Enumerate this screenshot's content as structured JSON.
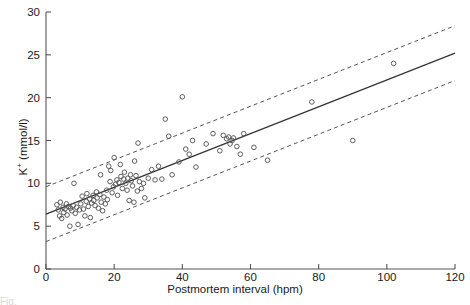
{
  "chart_data": {
    "type": "scatter",
    "title": "",
    "xlabel": "Postmortem interval (hpm)",
    "ylabel": "K+ (mmol/l)",
    "ylabel_base": "K",
    "ylabel_sup": "+",
    "ylabel_unit": " (mmol/l)",
    "xlim": [
      0,
      120
    ],
    "ylim": [
      0,
      30
    ],
    "xticks": [
      0,
      20,
      40,
      60,
      80,
      100,
      120
    ],
    "yticks": [
      0,
      5,
      10,
      15,
      20,
      25,
      30
    ],
    "grid": false,
    "legend": "none",
    "marker": "open-circle",
    "marker_color": "#555555",
    "line_color": "#333333",
    "band_color": "#555555",
    "regression_line": {
      "label": "regression line",
      "style": "solid",
      "intercept": 6.4,
      "slope": 0.1567,
      "x_start": 0,
      "x_end": 120,
      "y_start": 6.4,
      "y_end": 25.2
    },
    "prediction_band_upper": {
      "label": "upper prediction limit",
      "style": "dashed",
      "intercept": 9.6,
      "slope": 0.1567,
      "x_start": 0,
      "x_end": 120,
      "y_start": 9.6,
      "y_end": 28.4
    },
    "prediction_band_lower": {
      "label": "lower prediction limit",
      "style": "dashed",
      "intercept": 3.2,
      "slope": 0.1567,
      "x_start": 0,
      "x_end": 120,
      "y_start": 3.2,
      "y_end": 22.0
    },
    "points": [
      [
        3.2,
        7.5
      ],
      [
        3.6,
        6.9
      ],
      [
        4.0,
        6.2
      ],
      [
        4.2,
        7.8
      ],
      [
        4.6,
        5.9
      ],
      [
        5.0,
        7.2
      ],
      [
        5.2,
        6.6
      ],
      [
        5.6,
        7.0
      ],
      [
        6.0,
        7.6
      ],
      [
        6.2,
        6.3
      ],
      [
        6.6,
        7.3
      ],
      [
        7.0,
        5.0
      ],
      [
        7.2,
        7.1
      ],
      [
        7.6,
        6.8
      ],
      [
        8.0,
        7.4
      ],
      [
        8.2,
        10.0
      ],
      [
        8.6,
        6.5
      ],
      [
        9.0,
        7.2
      ],
      [
        9.4,
        5.2
      ],
      [
        9.8,
        6.9
      ],
      [
        10.2,
        7.6
      ],
      [
        10.6,
        8.5
      ],
      [
        11.0,
        7.0
      ],
      [
        11.4,
        6.2
      ],
      [
        11.8,
        7.9
      ],
      [
        12.0,
        8.8
      ],
      [
        12.4,
        7.3
      ],
      [
        12.8,
        8.2
      ],
      [
        13.0,
        6.0
      ],
      [
        13.4,
        7.7
      ],
      [
        13.8,
        8.6
      ],
      [
        14.0,
        8.0
      ],
      [
        14.4,
        7.4
      ],
      [
        14.8,
        9.0
      ],
      [
        15.0,
        8.3
      ],
      [
        15.4,
        7.1
      ],
      [
        15.8,
        8.7
      ],
      [
        16.0,
        11.0
      ],
      [
        16.2,
        7.8
      ],
      [
        16.6,
        6.8
      ],
      [
        17.0,
        8.4
      ],
      [
        17.4,
        7.6
      ],
      [
        17.8,
        9.2
      ],
      [
        18.0,
        8.1
      ],
      [
        18.4,
        12.0
      ],
      [
        18.8,
        10.2
      ],
      [
        19.0,
        11.5
      ],
      [
        19.4,
        8.9
      ],
      [
        19.8,
        9.6
      ],
      [
        20.0,
        13.0
      ],
      [
        20.4,
        9.9
      ],
      [
        20.8,
        10.4
      ],
      [
        21.0,
        8.6
      ],
      [
        21.4,
        10.1
      ],
      [
        21.8,
        12.2
      ],
      [
        22.0,
        10.8
      ],
      [
        22.4,
        9.4
      ],
      [
        22.8,
        10.5
      ],
      [
        23.0,
        11.3
      ],
      [
        23.4,
        10.0
      ],
      [
        23.8,
        9.2
      ],
      [
        24.0,
        10.6
      ],
      [
        24.4,
        8.0
      ],
      [
        24.8,
        11.0
      ],
      [
        25.0,
        10.3
      ],
      [
        25.4,
        9.7
      ],
      [
        25.8,
        7.8
      ],
      [
        26.0,
        12.6
      ],
      [
        26.4,
        10.9
      ],
      [
        26.8,
        9.1
      ],
      [
        27.0,
        14.7
      ],
      [
        27.4,
        10.2
      ],
      [
        28.0,
        9.4
      ],
      [
        28.6,
        10.0
      ],
      [
        29.0,
        8.3
      ],
      [
        30.0,
        10.6
      ],
      [
        31.0,
        11.6
      ],
      [
        32.0,
        10.4
      ],
      [
        33.0,
        12.0
      ],
      [
        34.0,
        10.5
      ],
      [
        35.0,
        17.5
      ],
      [
        36.0,
        15.5
      ],
      [
        37.0,
        11.0
      ],
      [
        39.0,
        12.5
      ],
      [
        40.0,
        20.1
      ],
      [
        41.0,
        14.0
      ],
      [
        42.0,
        13.4
      ],
      [
        43.0,
        15.0
      ],
      [
        44.0,
        11.9
      ],
      [
        47.0,
        14.6
      ],
      [
        49.0,
        15.8
      ],
      [
        51.0,
        13.8
      ],
      [
        52.0,
        15.6
      ],
      [
        53.0,
        15.2
      ],
      [
        53.6,
        15.4
      ],
      [
        54.0,
        14.6
      ],
      [
        54.6,
        15.0
      ],
      [
        55.0,
        15.3
      ],
      [
        56.0,
        14.3
      ],
      [
        57.0,
        13.4
      ],
      [
        58.0,
        15.8
      ],
      [
        61.0,
        14.2
      ],
      [
        65.0,
        12.7
      ],
      [
        78.0,
        19.5
      ],
      [
        90.0,
        15.0
      ],
      [
        102.0,
        24.0
      ]
    ]
  },
  "caption": {
    "partial_text": "Fig."
  }
}
